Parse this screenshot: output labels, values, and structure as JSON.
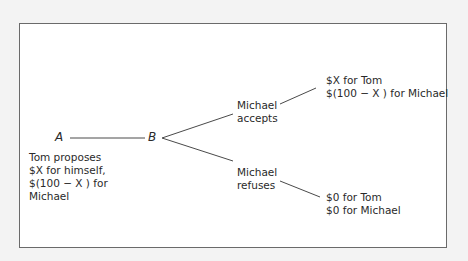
{
  "diagram": {
    "type": "game-tree",
    "nodes": {
      "a": {
        "label": "A"
      },
      "b": {
        "label": "B"
      }
    },
    "proposal": {
      "lines": [
        "Tom proposes",
        "$X for himself,",
        "$(100 − X ) for",
        "Michael"
      ]
    },
    "branches": [
      {
        "action_lines": [
          "Michael",
          "accepts"
        ],
        "payoff_lines": [
          "$X for Tom",
          "$(100 − X ) for Michael"
        ]
      },
      {
        "action_lines": [
          "Michael",
          "refuses"
        ],
        "payoff_lines": [
          "$0 for Tom",
          "$0 for Michael"
        ]
      }
    ]
  },
  "colors": {
    "background": "#f3f3f3",
    "frame_fill": "#ffffff",
    "frame_border": "#6a6a6a",
    "line": "#4a4a4a",
    "text": "#2a2a2a"
  }
}
